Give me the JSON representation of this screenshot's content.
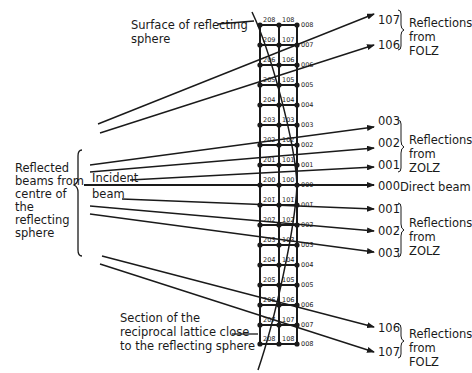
{
  "labels": {
    "surface": "Surface of reflecting",
    "surface_line2": "sphere",
    "reflected": [
      "Reflected",
      "beams from",
      "centre of",
      "the",
      "reflecting",
      "sphere"
    ],
    "incident": "Incident",
    "incident_line2": "beam",
    "section": [
      "Section of the",
      "reciprocal lattice close",
      "to the reflecting sphere"
    ],
    "direct_beam": "Direct beam"
  },
  "groups": [
    {
      "name": "folz-upper",
      "line1": "Reflections",
      "line2": "from FOLZ"
    },
    {
      "name": "zolz-upper",
      "line1": "Reflections",
      "line2": "from ZOLZ"
    },
    {
      "name": "zolz-lower",
      "line1": "Reflections",
      "line2": "from ZOLZ"
    },
    {
      "name": "folz-lower",
      "line1": "Reflections",
      "line2": "from FOLZ"
    }
  ],
  "reflections": {
    "r107": "107",
    "r106": "106",
    "r003": "003",
    "r002": "002",
    "r001": "001",
    "r000": "000",
    "r00m1": "001̄",
    "r00m2": "002̄",
    "r00m3": "003̄",
    "r10m6": "106̄",
    "r10m7": "107̄"
  },
  "lattice": {
    "col2": [
      "208",
      "209",
      "206",
      "205",
      "204",
      "203",
      "202",
      "201",
      "200",
      "201̄",
      "202̄",
      "203̄",
      "204̄",
      "205̄",
      "206̄",
      "207̄",
      "208̄"
    ],
    "col1": [
      "108",
      "107",
      "106",
      "105",
      "104",
      "103",
      "102",
      "101",
      "100",
      "101̄",
      "102̄",
      "103̄",
      "104̄",
      "105̄",
      "106̄",
      "107̄",
      "108̄"
    ],
    "col0": [
      "008",
      "007",
      "006",
      "005",
      "004",
      "003",
      "002",
      "001",
      "000",
      "001̄",
      "002̄",
      "003̄",
      "004̄",
      "005̄",
      "006̄",
      "007̄",
      "008̄"
    ]
  }
}
